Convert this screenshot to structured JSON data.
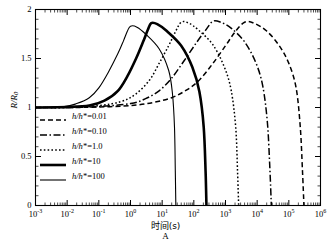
{
  "chart_data": {
    "type": "line",
    "title": "",
    "panel_label": "A",
    "xlabel": "时间(s)",
    "ylabel": "R/R0",
    "ylabel_parts": {
      "main": "R/R",
      "sub": "0"
    },
    "xscale": "log",
    "yscale": "linear",
    "xlim": [
      0.001,
      1000000
    ],
    "ylim": [
      0,
      2
    ],
    "grid": false,
    "legend_position": "lower-left inside axes",
    "xticks": [
      {
        "label": "10",
        "exp": "-3",
        "value": 0.001
      },
      {
        "label": "10",
        "exp": "-2",
        "value": 0.01
      },
      {
        "label": "10",
        "exp": "-1",
        "value": 0.1
      },
      {
        "label": "10",
        "exp": "0",
        "value": 1
      },
      {
        "label": "10",
        "exp": "1",
        "value": 10
      },
      {
        "label": "10",
        "exp": "2",
        "value": 100
      },
      {
        "label": "10",
        "exp": "3",
        "value": 1000
      },
      {
        "label": "10",
        "exp": "4",
        "value": 10000
      },
      {
        "label": "10",
        "exp": "5",
        "value": 100000
      },
      {
        "label": "10",
        "exp": "6",
        "value": 1000000
      }
    ],
    "yticks": [
      {
        "label": "0",
        "value": 0
      },
      {
        "label": "0.5",
        "value": 0.5
      },
      {
        "label": "1",
        "value": 1
      },
      {
        "label": "1.5",
        "value": 1.5
      },
      {
        "label": "2",
        "value": 2
      }
    ],
    "series": [
      {
        "name": "h/h*=0.01",
        "legend_main": "h/h",
        "legend_star": "*",
        "legend_value": "=0.01",
        "style": "dashed",
        "color": "#000000",
        "width": 1.5,
        "dash": "5,3",
        "peak_x": 4000,
        "peak_y": 1.87,
        "baseline_y": 1.0,
        "dropoff_x": 300000,
        "points": [
          [
            0.001,
            1.0
          ],
          [
            0.01,
            1.0
          ],
          [
            0.1,
            1.005
          ],
          [
            1,
            1.02
          ],
          [
            5,
            1.05
          ],
          [
            20,
            1.1
          ],
          [
            60,
            1.18
          ],
          [
            150,
            1.28
          ],
          [
            400,
            1.45
          ],
          [
            1000,
            1.63
          ],
          [
            2000,
            1.77
          ],
          [
            4000,
            1.87
          ],
          [
            8000,
            1.86
          ],
          [
            20000,
            1.78
          ],
          [
            50000,
            1.63
          ],
          [
            100000,
            1.45
          ],
          [
            170000,
            1.2
          ],
          [
            230000,
            0.8
          ],
          [
            270000,
            0.35
          ],
          [
            300000,
            0.0
          ]
        ]
      },
      {
        "name": "h/h*=0.10",
        "legend_main": "h/h",
        "legend_star": "*",
        "legend_value": "=0.10",
        "style": "dash-dot",
        "color": "#000000",
        "width": 1.5,
        "dash": "7,2.5,1.5,2.5",
        "peak_x": 400,
        "peak_y": 1.88,
        "baseline_y": 1.0,
        "dropoff_x": 28000,
        "points": [
          [
            0.001,
            1.0
          ],
          [
            0.01,
            1.0
          ],
          [
            0.1,
            1.01
          ],
          [
            1,
            1.04
          ],
          [
            3,
            1.09
          ],
          [
            8,
            1.17
          ],
          [
            20,
            1.3
          ],
          [
            50,
            1.48
          ],
          [
            120,
            1.66
          ],
          [
            250,
            1.8
          ],
          [
            400,
            1.88
          ],
          [
            700,
            1.87
          ],
          [
            1500,
            1.81
          ],
          [
            4000,
            1.67
          ],
          [
            9000,
            1.46
          ],
          [
            15000,
            1.22
          ],
          [
            21000,
            0.85
          ],
          [
            25000,
            0.4
          ],
          [
            28000,
            0.0
          ]
        ]
      },
      {
        "name": "h/h*=1.0",
        "legend_main": "h/h",
        "legend_star": "*",
        "legend_value": "=1.0",
        "style": "dotted",
        "color": "#000000",
        "width": 1.5,
        "dash": "1.6,2.2",
        "peak_x": 40,
        "peak_y": 1.87,
        "baseline_y": 1.0,
        "dropoff_x": 2600,
        "points": [
          [
            0.001,
            1.0
          ],
          [
            0.01,
            1.0
          ],
          [
            0.1,
            1.02
          ],
          [
            0.5,
            1.06
          ],
          [
            1.5,
            1.14
          ],
          [
            4,
            1.28
          ],
          [
            8,
            1.45
          ],
          [
            16,
            1.63
          ],
          [
            26,
            1.77
          ],
          [
            40,
            1.87
          ],
          [
            70,
            1.86
          ],
          [
            140,
            1.79
          ],
          [
            400,
            1.64
          ],
          [
            900,
            1.42
          ],
          [
            1500,
            1.18
          ],
          [
            2100,
            0.8
          ],
          [
            2400,
            0.35
          ],
          [
            2600,
            0.0
          ]
        ]
      },
      {
        "name": "h/h*=10",
        "legend_main": "h/h",
        "legend_star": "*",
        "legend_value": "=10",
        "style": "solid-thick",
        "color": "#000000",
        "width": 2.6,
        "dash": "",
        "peak_x": 4.5,
        "peak_y": 1.86,
        "baseline_y": 1.0,
        "dropoff_x": 250,
        "points": [
          [
            0.001,
            1.0
          ],
          [
            0.01,
            1.005
          ],
          [
            0.05,
            1.02
          ],
          [
            0.15,
            1.07
          ],
          [
            0.4,
            1.17
          ],
          [
            0.8,
            1.32
          ],
          [
            1.5,
            1.5
          ],
          [
            2.5,
            1.67
          ],
          [
            3.5,
            1.79
          ],
          [
            4.5,
            1.86
          ],
          [
            7,
            1.85
          ],
          [
            14,
            1.78
          ],
          [
            40,
            1.63
          ],
          [
            90,
            1.41
          ],
          [
            150,
            1.16
          ],
          [
            205,
            0.8
          ],
          [
            235,
            0.35
          ],
          [
            250,
            0.0
          ]
        ]
      },
      {
        "name": "h/h*=100",
        "legend_main": "h/h",
        "legend_star": "*",
        "legend_value": "=100",
        "style": "solid-thin",
        "color": "#000000",
        "width": 1.1,
        "dash": "",
        "peak_x": 1.0,
        "peak_y": 1.83,
        "baseline_y": 1.0,
        "dropoff_x": 27,
        "points": [
          [
            0.001,
            1.0
          ],
          [
            0.008,
            1.01
          ],
          [
            0.02,
            1.04
          ],
          [
            0.05,
            1.1
          ],
          [
            0.1,
            1.2
          ],
          [
            0.2,
            1.36
          ],
          [
            0.4,
            1.55
          ],
          [
            0.6,
            1.68
          ],
          [
            0.8,
            1.78
          ],
          [
            1.0,
            1.83
          ],
          [
            1.6,
            1.82
          ],
          [
            3,
            1.75
          ],
          [
            8,
            1.6
          ],
          [
            16,
            1.38
          ],
          [
            21,
            1.15
          ],
          [
            24.5,
            0.8
          ],
          [
            26,
            0.35
          ],
          [
            27,
            0.0
          ]
        ]
      }
    ]
  }
}
